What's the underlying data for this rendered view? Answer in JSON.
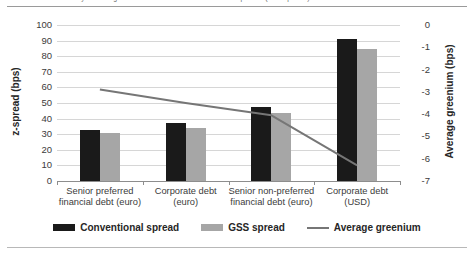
{
  "caption": {
    "text": "Chart 2: Greenium by bond segment — conventional versus GSS z-spreads (basis points)"
  },
  "chart_data": {
    "type": "bar",
    "title": "",
    "subtitle": "",
    "xlabel": "",
    "ylabel": "z-spread (bps)",
    "y2label": "Average greenium (bps)",
    "grid": true,
    "legend_position": "bottom",
    "categories": [
      "Senior preferred\nfinancial debt (euro)",
      "Corporate debt (euro)",
      "Senior non-preferred\nfinancial debt (euro)",
      "Corporate debt (USD)"
    ],
    "ylim": [
      0,
      100
    ],
    "yticks": [
      "0",
      "10",
      "20",
      "30",
      "40",
      "50",
      "60",
      "70",
      "80",
      "90",
      "100"
    ],
    "y2lim": [
      -7,
      0
    ],
    "y2ticks": [
      "0",
      "-1",
      "-2",
      "-3",
      "-4",
      "-5",
      "-6",
      "-7"
    ],
    "series": [
      {
        "name": "Conventional spread",
        "type": "bar",
        "axis": "left",
        "color": "#1a1a1a",
        "values": [
          33,
          37,
          47.5,
          91
        ]
      },
      {
        "name": "GSS spread",
        "type": "bar",
        "axis": "left",
        "color": "#a6a6a6",
        "values": [
          30.5,
          34,
          43.5,
          84.5
        ]
      },
      {
        "name": "Average greenium",
        "type": "line",
        "axis": "right",
        "color": "#767676",
        "values": [
          -2.9,
          -3.5,
          -4.05,
          -6.3
        ]
      }
    ]
  },
  "legend": {
    "items": [
      {
        "label": "Conventional spread",
        "marker": "bar-swatch-dark"
      },
      {
        "label": "GSS spread",
        "marker": "bar-swatch-gray"
      },
      {
        "label": "Average greenium",
        "marker": "line-swatch-gray"
      }
    ]
  }
}
